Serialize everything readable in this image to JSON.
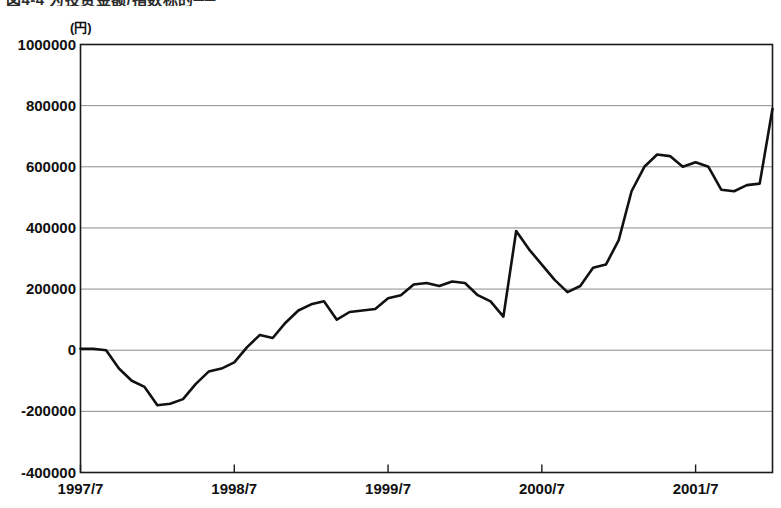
{
  "figure": {
    "title_fragment": "図4-4 为投资金额/指数标的──",
    "unit_label": "(円)"
  },
  "chart_data": {
    "type": "line",
    "title": "",
    "xlabel": "",
    "ylabel": "",
    "unit": "円",
    "ylim": [
      -400000,
      1000000
    ],
    "ytick_step": 200000,
    "grid": true,
    "legend": "none",
    "yticks": [
      "1000000",
      "800000",
      "600000",
      "400000",
      "200000",
      "0",
      "-200000",
      "-400000"
    ],
    "ytick_values": [
      1000000,
      800000,
      600000,
      400000,
      200000,
      0,
      -200000,
      -400000
    ],
    "xticks": [
      "1997/7",
      "1998/7",
      "1999/7",
      "2000/7",
      "2001/7"
    ],
    "xtick_values": [
      "1997-07",
      "1998-07",
      "1999-07",
      "2000-07",
      "2001-07"
    ],
    "x_start": "1997-07",
    "x_end": "2002-01",
    "x_step_months": 1,
    "series": [
      {
        "name": "累積投資損益",
        "color": "#111111",
        "x": [
          "1997-07",
          "1997-08",
          "1997-09",
          "1997-10",
          "1997-11",
          "1997-12",
          "1998-01",
          "1998-02",
          "1998-03",
          "1998-04",
          "1998-05",
          "1998-06",
          "1998-07",
          "1998-08",
          "1998-09",
          "1998-10",
          "1998-11",
          "1998-12",
          "1999-01",
          "1999-02",
          "1999-03",
          "1999-04",
          "1999-05",
          "1999-06",
          "1999-07",
          "1999-08",
          "1999-09",
          "1999-10",
          "1999-11",
          "1999-12",
          "2000-01",
          "2000-02",
          "2000-03",
          "2000-04",
          "2000-05",
          "2000-06",
          "2000-07",
          "2000-08",
          "2000-09",
          "2000-10",
          "2000-11",
          "2000-12",
          "2001-01",
          "2001-02",
          "2001-03",
          "2001-04",
          "2001-05",
          "2001-06",
          "2001-07",
          "2001-08",
          "2001-09",
          "2001-10",
          "2001-11",
          "2001-12",
          "2002-01"
        ],
        "values": [
          5000,
          5000,
          0,
          -60000,
          -100000,
          -120000,
          -180000,
          -175000,
          -160000,
          -110000,
          -70000,
          -60000,
          -40000,
          10000,
          50000,
          40000,
          90000,
          130000,
          150000,
          160000,
          100000,
          125000,
          130000,
          135000,
          170000,
          180000,
          215000,
          220000,
          210000,
          225000,
          220000,
          180000,
          160000,
          110000,
          390000,
          330000,
          280000,
          230000,
          190000,
          210000,
          270000,
          280000,
          360000,
          520000,
          600000,
          640000,
          635000,
          600000,
          615000,
          600000,
          525000,
          520000,
          540000,
          545000,
          790000
        ]
      }
    ]
  }
}
